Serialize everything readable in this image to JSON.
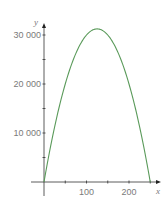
{
  "chart_data": {
    "type": "line",
    "title": "",
    "xlabel": "x",
    "ylabel": "y",
    "xlim": [
      0,
      270
    ],
    "ylim": [
      0,
      33000
    ],
    "grid": false,
    "legend": null,
    "x_ticks": [
      50,
      100,
      150,
      200,
      250
    ],
    "x_tick_labels": [
      {
        "value": 100,
        "label": "100"
      },
      {
        "value": 200,
        "label": "200"
      }
    ],
    "y_ticks": [
      5000,
      10000,
      15000,
      20000,
      25000,
      30000
    ],
    "y_tick_labels": [
      {
        "value": 10000,
        "label": "10 000"
      },
      {
        "value": 20000,
        "label": "20 000"
      },
      {
        "value": 30000,
        "label": "30 000"
      }
    ],
    "series": [
      {
        "name": "y = 500x - 2x^2",
        "color": "#5a9a5a",
        "x": [
          0,
          25,
          50,
          75,
          100,
          125,
          150,
          175,
          200,
          225,
          250
        ],
        "y": [
          0,
          11250,
          20000,
          26250,
          30000,
          31250,
          30000,
          26250,
          20000,
          11250,
          0
        ]
      }
    ]
  },
  "axes": {
    "x_label": "x",
    "y_label": "y",
    "axis_color": "#333333",
    "label_color": "#7a7a7a"
  }
}
